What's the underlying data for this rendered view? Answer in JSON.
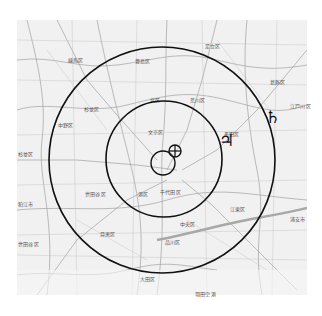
{
  "map": {
    "description": "Grayscale map of a metropolitan region with concentric circles and astronomical symbols overlaid",
    "background_color": "#f1f1f1",
    "line_color": "#111111",
    "district_labels": [
      {
        "text": "練馬区",
        "x": 68,
        "y": 56
      },
      {
        "text": "足立区",
        "x": 205,
        "y": 42
      },
      {
        "text": "葛飾区",
        "x": 270,
        "y": 78
      },
      {
        "text": "豊島区",
        "x": 135,
        "y": 57
      },
      {
        "text": "荒川区",
        "x": 190,
        "y": 96
      },
      {
        "text": "江戸川区",
        "x": 290,
        "y": 102
      },
      {
        "text": "北区",
        "x": 150,
        "y": 96
      },
      {
        "text": "杉並区",
        "x": 84,
        "y": 105
      },
      {
        "text": "文京区",
        "x": 148,
        "y": 128
      },
      {
        "text": "墨田区",
        "x": 224,
        "y": 130
      },
      {
        "text": "中野区",
        "x": 58,
        "y": 121
      },
      {
        "text": "杉並区",
        "x": 18,
        "y": 150
      },
      {
        "text": "千代田区",
        "x": 160,
        "y": 188
      },
      {
        "text": "港区",
        "x": 138,
        "y": 190
      },
      {
        "text": "世田谷区",
        "x": 85,
        "y": 190
      },
      {
        "text": "目黒区",
        "x": 100,
        "y": 230
      },
      {
        "text": "中央区",
        "x": 180,
        "y": 220
      },
      {
        "text": "江東区",
        "x": 230,
        "y": 205
      },
      {
        "text": "品川区",
        "x": 165,
        "y": 238
      },
      {
        "text": "大田区",
        "x": 140,
        "y": 275
      },
      {
        "text": "狛江市",
        "x": 18,
        "y": 200
      },
      {
        "text": "世田谷区",
        "x": 18,
        "y": 240
      },
      {
        "text": "羽田空港",
        "x": 195,
        "y": 290
      },
      {
        "text": "浦安市",
        "x": 290,
        "y": 215
      }
    ],
    "overlays": {
      "outer_circle": {
        "cx": 162,
        "cy": 160,
        "r": 113
      },
      "middle_circle": {
        "cx": 164,
        "cy": 159,
        "r": 58
      },
      "inner_circle": {
        "cx": 163,
        "cy": 163,
        "r": 12
      },
      "earth_symbol": {
        "glyph": "⊕",
        "cx": 175,
        "cy": 151,
        "r": 6
      },
      "jupiter_symbol": {
        "glyph": "♃",
        "x": 219,
        "y": 146
      },
      "saturn_symbol": {
        "glyph": "♄",
        "x": 265,
        "y": 123
      }
    }
  }
}
